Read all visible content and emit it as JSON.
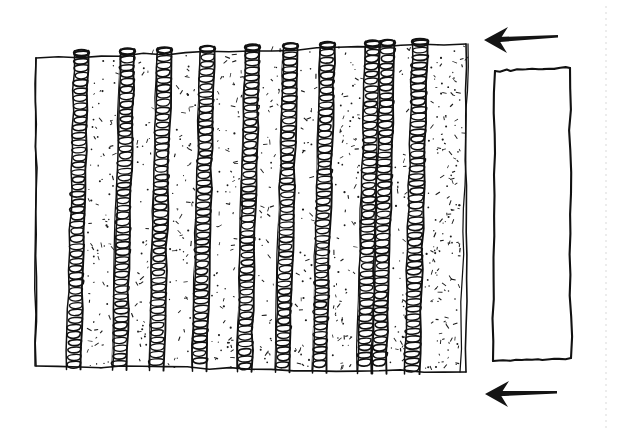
{
  "figure": {
    "medium": "pen and ink line sketch",
    "background_color": "#ffffff",
    "ink_color": "#111111",
    "width": 621,
    "height": 433
  },
  "main_block": {
    "name": "laminated-coil-block",
    "description": "Rectangular block drawn in slight perspective, built from alternating vertical coil layers and stippled slab panels",
    "outline": {
      "top_left": [
        36,
        58
      ],
      "top_right": [
        466,
        44
      ],
      "bottom_right": [
        466,
        372
      ],
      "bottom_left": [
        36,
        366
      ],
      "stroke_width": 1.6
    },
    "blank_panel": {
      "name": "blank-end-panel",
      "label": "",
      "x_left": 36,
      "x_right": 72,
      "fill": "#ffffff",
      "stippled": false
    },
    "coil_count": 10,
    "panel_count": 10,
    "coil_color": "#111111",
    "stipple_color": "#1a1a1a",
    "layers": [
      {
        "index": 1,
        "coil_x_top": 74,
        "coil_x_bottom": 66,
        "coil_width": 15,
        "panel_x_top": 89,
        "panel_x_bottom": 81,
        "panel_width": 31,
        "stipple_density": 0.3
      },
      {
        "index": 2,
        "coil_x_top": 120,
        "coil_x_bottom": 112,
        "coil_width": 15,
        "panel_x_top": 135,
        "panel_x_bottom": 127,
        "panel_width": 22,
        "stipple_density": 0.22
      },
      {
        "index": 3,
        "coil_x_top": 157,
        "coil_x_bottom": 149,
        "coil_width": 15,
        "panel_x_top": 172,
        "panel_x_bottom": 164,
        "panel_width": 28,
        "stipple_density": 0.26
      },
      {
        "index": 4,
        "coil_x_top": 200,
        "coil_x_bottom": 192,
        "coil_width": 15,
        "panel_x_top": 215,
        "panel_x_bottom": 207,
        "panel_width": 30,
        "stipple_density": 0.28
      },
      {
        "index": 5,
        "coil_x_top": 245,
        "coil_x_bottom": 237,
        "coil_width": 15,
        "panel_x_top": 260,
        "panel_x_bottom": 252,
        "panel_width": 23,
        "stipple_density": 0.24
      },
      {
        "index": 6,
        "coil_x_top": 283,
        "coil_x_bottom": 275,
        "coil_width": 15,
        "panel_x_top": 298,
        "panel_x_bottom": 290,
        "panel_width": 22,
        "stipple_density": 0.22
      },
      {
        "index": 7,
        "coil_x_top": 320,
        "coil_x_bottom": 312,
        "coil_width": 15,
        "panel_x_top": 335,
        "panel_x_bottom": 327,
        "panel_width": 30,
        "stipple_density": 0.3
      },
      {
        "index": 8,
        "coil_x_top": 365,
        "coil_x_bottom": 357,
        "coil_width": 15,
        "panel_x_top": 380,
        "panel_x_bottom": 372,
        "panel_width": 14,
        "stipple_density": 0.18
      },
      {
        "index": 9,
        "coil_x_top": 380,
        "coil_x_bottom": 372,
        "coil_width": 15,
        "panel_x_top": 395,
        "panel_x_bottom": 387,
        "panel_width": 19,
        "stipple_density": 0.22
      },
      {
        "index": 10,
        "coil_x_top": 412,
        "coil_x_bottom": 404,
        "coil_width": 16,
        "panel_x_top": 428,
        "panel_x_bottom": 420,
        "panel_width": 40,
        "stipple_density": 0.42
      }
    ]
  },
  "side_block": {
    "name": "plain-side-block",
    "description": "Separate empty hand-drawn rectangle to the right of the main block",
    "fill": "#ffffff",
    "stroke_width": 2.1,
    "corners": {
      "top_left": [
        495,
        71
      ],
      "top_right": [
        570,
        68
      ],
      "bottom_right": [
        571,
        358
      ],
      "bottom_left": [
        493,
        361
      ]
    }
  },
  "arrows": [
    {
      "name": "direction-arrow-top",
      "points_to": "left",
      "tip": [
        484,
        40
      ],
      "tail": [
        558,
        36
      ],
      "head_length": 24,
      "head_half_height": 13,
      "color": "#141414"
    },
    {
      "name": "direction-arrow-bottom",
      "points_to": "left",
      "tip": [
        485,
        394
      ],
      "tail": [
        557,
        392
      ],
      "head_length": 24,
      "head_half_height": 13,
      "color": "#141414"
    }
  ],
  "page_edge": {
    "name": "page-edge-guide",
    "description": "Faint dotted vertical scan guide at the right margin",
    "x": 606,
    "y_top": 6,
    "y_bottom": 428,
    "color": "#d9d9d9"
  }
}
